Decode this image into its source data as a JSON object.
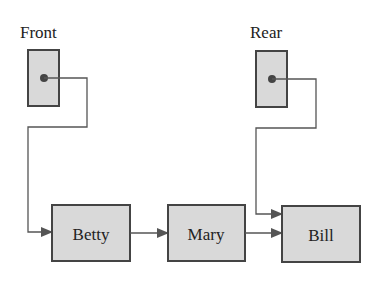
{
  "diagram": {
    "pointers": [
      {
        "label": "Front",
        "target": "Betty"
      },
      {
        "label": "Rear",
        "target": "Bill"
      }
    ],
    "nodes": [
      {
        "label": "Betty"
      },
      {
        "label": "Mary"
      },
      {
        "label": "Bill"
      }
    ],
    "colors": {
      "box_fill": "#d9d9d9",
      "box_stroke": "#444444",
      "line": "#555555",
      "text": "#222222"
    }
  }
}
